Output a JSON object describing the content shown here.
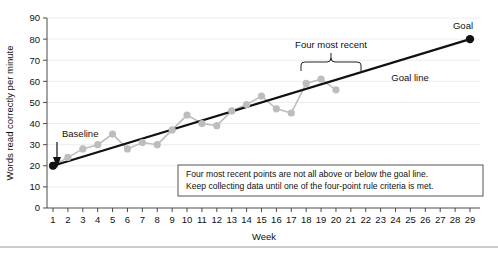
{
  "chart_data": {
    "type": "line",
    "title": "",
    "xlabel": "Week",
    "ylabel": "Words read correctly per minute",
    "xlim": [
      1,
      29
    ],
    "ylim": [
      0,
      90
    ],
    "ytick_step": 10,
    "grid": true,
    "legend_position": "none",
    "x": [
      1,
      2,
      3,
      4,
      5,
      6,
      7,
      8,
      9,
      10,
      11,
      12,
      13,
      14,
      15,
      16,
      17,
      18,
      19,
      20
    ],
    "yticks": [
      0,
      10,
      20,
      30,
      40,
      50,
      60,
      70,
      80,
      90
    ],
    "xticks": [
      1,
      2,
      3,
      4,
      5,
      6,
      7,
      8,
      9,
      10,
      11,
      12,
      13,
      14,
      15,
      16,
      17,
      18,
      19,
      20,
      21,
      22,
      23,
      24,
      25,
      26,
      27,
      28,
      29
    ],
    "series": [
      {
        "name": "Words read correctly per minute",
        "color": "#bdbdbd",
        "values": [
          20,
          24,
          28,
          30,
          35,
          28,
          31,
          30,
          37,
          44,
          40,
          39,
          46,
          49,
          53,
          47,
          45,
          59,
          61,
          56
        ]
      },
      {
        "name": "Goal line",
        "color": "#111111",
        "points": [
          [
            1,
            20
          ],
          [
            29,
            80
          ]
        ]
      }
    ],
    "baseline": {
      "week": 1,
      "value": 20
    },
    "goal": {
      "week": 29,
      "value": 80
    },
    "four_most_recent_weeks": [
      17,
      18,
      19,
      20
    ]
  },
  "labels": {
    "y_axis_title": "Words read correctly per minute",
    "x_axis_title": "Week",
    "baseline": "Baseline",
    "goal": "Goal",
    "goal_line": "Goal line",
    "four_most_recent": "Four most recent"
  },
  "note": {
    "line1": "Four most recent points are not all above or below the goal line.",
    "line2": "Keep collecting data until one of the four-point rule criteria is met."
  },
  "ytick_labels": [
    "0",
    "10",
    "20",
    "30",
    "40",
    "50",
    "60",
    "70",
    "80",
    "90"
  ],
  "xtick_labels": [
    "1",
    "2",
    "3",
    "4",
    "5",
    "6",
    "7",
    "8",
    "9",
    "10",
    "11",
    "12",
    "13",
    "14",
    "15",
    "16",
    "17",
    "18",
    "19",
    "20",
    "21",
    "22",
    "23",
    "24",
    "25",
    "26",
    "27",
    "28",
    "29"
  ],
  "colors": {
    "data": "#bdbdbd",
    "goal": "#111111",
    "grid": "#e8e8e8",
    "axis": "#4a4a4a",
    "note_border": "#555555"
  }
}
